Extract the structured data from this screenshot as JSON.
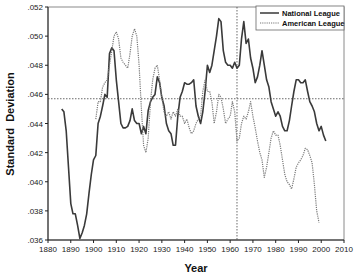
{
  "chart_data": {
    "type": "line",
    "title": "",
    "xlabel": "Year",
    "ylabel": "Standard  Deviation",
    "xlim": [
      1880,
      2010
    ],
    "ylim": [
      0.036,
      0.052
    ],
    "x_ticks": [
      "1880",
      "1890",
      "1900",
      "1910",
      "1920",
      "1930",
      "1940",
      "1950",
      "1960",
      "1970",
      "1980",
      "1990",
      "2000",
      "2010"
    ],
    "y_ticks": [
      ".036",
      ".038",
      ".040",
      ".042",
      ".044",
      ".046",
      ".048",
      ".050",
      ".052"
    ],
    "grid": false,
    "legend_position": "upper right",
    "reference_lines": {
      "horizontal_y": 0.0457,
      "vertical_x": 1963
    },
    "series": [
      {
        "name": "National League",
        "style": "solid",
        "x": [
          1886,
          1887,
          1888,
          1889,
          1890,
          1891,
          1892,
          1893,
          1894,
          1895,
          1896,
          1897,
          1898,
          1899,
          1900,
          1901,
          1902,
          1903,
          1904,
          1905,
          1906,
          1907,
          1908,
          1909,
          1910,
          1911,
          1912,
          1913,
          1914,
          1915,
          1916,
          1917,
          1918,
          1919,
          1920,
          1921,
          1922,
          1923,
          1924,
          1925,
          1926,
          1927,
          1928,
          1929,
          1930,
          1931,
          1932,
          1933,
          1934,
          1935,
          1936,
          1937,
          1938,
          1939,
          1940,
          1941,
          1942,
          1943,
          1944,
          1945,
          1946,
          1947,
          1948,
          1949,
          1950,
          1951,
          1952,
          1953,
          1954,
          1955,
          1956,
          1957,
          1958,
          1959,
          1960,
          1961,
          1962,
          1963,
          1964,
          1965,
          1966,
          1967,
          1968,
          1969,
          1970,
          1971,
          1972,
          1973,
          1974,
          1975,
          1976,
          1977,
          1978,
          1979,
          1980,
          1981,
          1982,
          1983,
          1984,
          1985,
          1986,
          1987,
          1988,
          1989,
          1990,
          1991,
          1992,
          1993,
          1994,
          1995,
          1996,
          1997,
          1998,
          1999,
          2000,
          2001,
          2002
        ],
        "values": [
          0.045,
          0.0448,
          0.0435,
          0.041,
          0.0385,
          0.0378,
          0.0378,
          0.037,
          0.0361,
          0.0365,
          0.037,
          0.0378,
          0.0392,
          0.0405,
          0.0415,
          0.0418,
          0.044,
          0.0445,
          0.0452,
          0.046,
          0.0458,
          0.0488,
          0.0492,
          0.049,
          0.047,
          0.0455,
          0.044,
          0.0437,
          0.0437,
          0.0438,
          0.0442,
          0.045,
          0.0442,
          0.044,
          0.044,
          0.0433,
          0.0438,
          0.0433,
          0.0449,
          0.0455,
          0.0458,
          0.046,
          0.0472,
          0.0468,
          0.0458,
          0.0452,
          0.044,
          0.0435,
          0.0433,
          0.0425,
          0.0425,
          0.0445,
          0.0458,
          0.0462,
          0.0468,
          0.0467,
          0.0467,
          0.0468,
          0.047,
          0.0452,
          0.0445,
          0.044,
          0.0448,
          0.0462,
          0.048,
          0.0475,
          0.048,
          0.049,
          0.05,
          0.0512,
          0.051,
          0.049,
          0.0482,
          0.048,
          0.048,
          0.0478,
          0.0482,
          0.0478,
          0.048,
          0.0498,
          0.051,
          0.0495,
          0.0498,
          0.0485,
          0.0478,
          0.0468,
          0.0472,
          0.048,
          0.049,
          0.048,
          0.047,
          0.0465,
          0.0455,
          0.045,
          0.0445,
          0.0448,
          0.0445,
          0.0438,
          0.0435,
          0.0435,
          0.0442,
          0.0452,
          0.0462,
          0.047,
          0.047,
          0.0468,
          0.0468,
          0.047,
          0.0462,
          0.0455,
          0.0452,
          0.0448,
          0.044,
          0.0435,
          0.0438,
          0.0432,
          0.0428
        ]
      },
      {
        "name": "American League",
        "style": "dotted",
        "x": [
          1901,
          1902,
          1903,
          1904,
          1905,
          1906,
          1907,
          1908,
          1909,
          1910,
          1911,
          1912,
          1913,
          1914,
          1915,
          1916,
          1917,
          1918,
          1919,
          1920,
          1921,
          1922,
          1923,
          1924,
          1925,
          1926,
          1927,
          1928,
          1929,
          1930,
          1931,
          1932,
          1933,
          1934,
          1935,
          1936,
          1937,
          1938,
          1939,
          1940,
          1941,
          1942,
          1943,
          1944,
          1945,
          1946,
          1947,
          1948,
          1949,
          1950,
          1951,
          1952,
          1953,
          1954,
          1955,
          1956,
          1957,
          1958,
          1959,
          1960,
          1961,
          1962,
          1963,
          1964,
          1965,
          1966,
          1967,
          1968,
          1969,
          1970,
          1971,
          1972,
          1973,
          1974,
          1975,
          1976,
          1977,
          1978,
          1979,
          1980,
          1981,
          1982,
          1983,
          1984,
          1985,
          1986,
          1987,
          1988,
          1989,
          1990,
          1991,
          1992,
          1993,
          1994,
          1995,
          1996,
          1997,
          1998,
          1999
        ],
        "values": [
          0.0443,
          0.0455,
          0.0455,
          0.0465,
          0.0468,
          0.047,
          0.048,
          0.049,
          0.05,
          0.0503,
          0.0498,
          0.0485,
          0.0482,
          0.048,
          0.0478,
          0.0488,
          0.05,
          0.0505,
          0.05,
          0.048,
          0.045,
          0.0425,
          0.042,
          0.043,
          0.0455,
          0.047,
          0.0478,
          0.048,
          0.047,
          0.0458,
          0.0448,
          0.0445,
          0.0448,
          0.0443,
          0.0448,
          0.0445,
          0.045,
          0.0445,
          0.0445,
          0.044,
          0.0443,
          0.0437,
          0.0433,
          0.0435,
          0.044,
          0.0443,
          0.0445,
          0.0462,
          0.047,
          0.0462,
          0.0462,
          0.0455,
          0.044,
          0.0448,
          0.046,
          0.0458,
          0.045,
          0.044,
          0.0443,
          0.0445,
          0.0455,
          0.0448,
          0.0428,
          0.043,
          0.044,
          0.0445,
          0.0443,
          0.0448,
          0.0455,
          0.0445,
          0.0437,
          0.0428,
          0.042,
          0.0415,
          0.0403,
          0.041,
          0.042,
          0.043,
          0.0435,
          0.0432,
          0.0432,
          0.0425,
          0.0415,
          0.0405,
          0.04,
          0.0398,
          0.0395,
          0.0402,
          0.041,
          0.0413,
          0.0415,
          0.0418,
          0.0423,
          0.0422,
          0.0418,
          0.0413,
          0.0398,
          0.038,
          0.0372
        ]
      }
    ]
  },
  "legend": {
    "items": [
      {
        "label": "National League"
      },
      {
        "label": "American League"
      }
    ]
  },
  "axes": {
    "xlabel": "Year",
    "ylabel": "Standard  Deviation"
  }
}
